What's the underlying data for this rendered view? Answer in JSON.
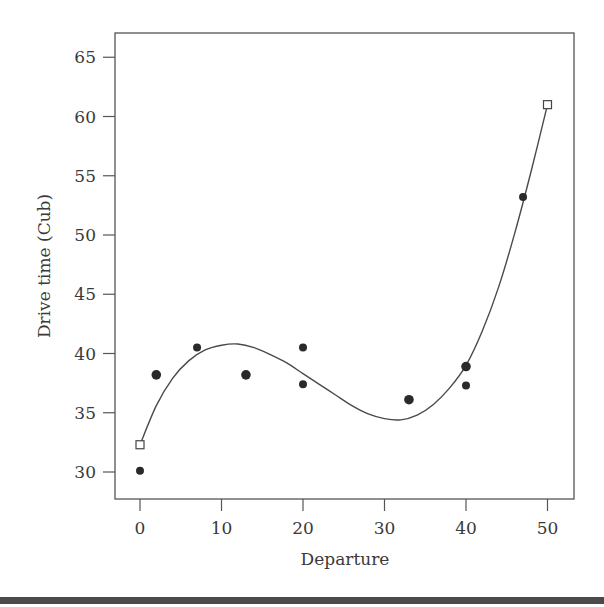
{
  "chart_data": {
    "type": "scatter",
    "title": "",
    "xlabel": "Departure",
    "ylabel": "Drive time (Cub)",
    "xlim": [
      -3,
      53.2
    ],
    "ylim": [
      27.8,
      67.2
    ],
    "xticks": [
      0,
      10,
      20,
      30,
      40,
      50
    ],
    "yticks": [
      30,
      35,
      40,
      45,
      50,
      55,
      60,
      65
    ],
    "grid": false,
    "legend": null,
    "series": [
      {
        "name": "observed",
        "marker": "filled-circle",
        "points": [
          {
            "x": 0,
            "y": 30.1
          },
          {
            "x": 2,
            "y": 38.2
          },
          {
            "x": 7,
            "y": 40.5
          },
          {
            "x": 13,
            "y": 38.2
          },
          {
            "x": 20,
            "y": 40.5
          },
          {
            "x": 20,
            "y": 37.4
          },
          {
            "x": 33,
            "y": 36.1
          },
          {
            "x": 40,
            "y": 38.9
          },
          {
            "x": 40,
            "y": 37.3
          },
          {
            "x": 47,
            "y": 53.2
          }
        ]
      },
      {
        "name": "endpoints",
        "marker": "open-square",
        "points": [
          {
            "x": 0,
            "y": 32.3
          },
          {
            "x": 50,
            "y": 61.0
          }
        ]
      },
      {
        "name": "fitted-curve",
        "type": "line",
        "points": [
          {
            "x": 0,
            "y": 32.3
          },
          {
            "x": 2,
            "y": 35.6
          },
          {
            "x": 4,
            "y": 37.9
          },
          {
            "x": 6,
            "y": 39.4
          },
          {
            "x": 8,
            "y": 40.3
          },
          {
            "x": 10,
            "y": 40.7
          },
          {
            "x": 12,
            "y": 40.8
          },
          {
            "x": 14,
            "y": 40.5
          },
          {
            "x": 16,
            "y": 39.9
          },
          {
            "x": 18,
            "y": 39.2
          },
          {
            "x": 20,
            "y": 38.3
          },
          {
            "x": 22,
            "y": 37.4
          },
          {
            "x": 24,
            "y": 36.5
          },
          {
            "x": 26,
            "y": 35.6
          },
          {
            "x": 28,
            "y": 34.9
          },
          {
            "x": 30,
            "y": 34.5
          },
          {
            "x": 32,
            "y": 34.4
          },
          {
            "x": 34,
            "y": 34.8
          },
          {
            "x": 36,
            "y": 35.7
          },
          {
            "x": 38,
            "y": 37.1
          },
          {
            "x": 40,
            "y": 39.0
          },
          {
            "x": 42,
            "y": 41.9
          },
          {
            "x": 44,
            "y": 45.6
          },
          {
            "x": 46,
            "y": 50.2
          },
          {
            "x": 48,
            "y": 55.4
          },
          {
            "x": 50,
            "y": 61.0
          }
        ]
      }
    ]
  }
}
